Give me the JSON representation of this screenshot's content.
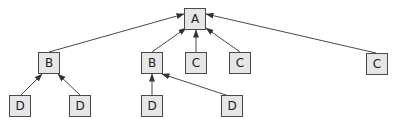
{
  "diagram": {
    "type": "tree",
    "edge_direction": "child-to-parent",
    "colors": {
      "node_fill": "#e6e6e6",
      "node_border": "#4a4a4a",
      "edge": "#333333",
      "label": "#222222"
    },
    "nodes": [
      {
        "id": "a",
        "label": "A",
        "x": 184,
        "y": 8
      },
      {
        "id": "b1",
        "label": "B",
        "x": 38,
        "y": 52
      },
      {
        "id": "b2",
        "label": "B",
        "x": 141,
        "y": 52
      },
      {
        "id": "c1",
        "label": "C",
        "x": 185,
        "y": 52
      },
      {
        "id": "c2",
        "label": "C",
        "x": 229,
        "y": 52
      },
      {
        "id": "c3",
        "label": "C",
        "x": 366,
        "y": 53
      },
      {
        "id": "d1",
        "label": "D",
        "x": 9,
        "y": 95
      },
      {
        "id": "d2",
        "label": "D",
        "x": 69,
        "y": 95
      },
      {
        "id": "d3",
        "label": "D",
        "x": 141,
        "y": 95
      },
      {
        "id": "d4",
        "label": "D",
        "x": 221,
        "y": 95
      }
    ],
    "edges": [
      {
        "from": "b1",
        "to": "a"
      },
      {
        "from": "b2",
        "to": "a"
      },
      {
        "from": "c1",
        "to": "a"
      },
      {
        "from": "c2",
        "to": "a"
      },
      {
        "from": "c3",
        "to": "a"
      },
      {
        "from": "d1",
        "to": "b1"
      },
      {
        "from": "d2",
        "to": "b1"
      },
      {
        "from": "d3",
        "to": "b2"
      },
      {
        "from": "d4",
        "to": "b2"
      }
    ]
  }
}
